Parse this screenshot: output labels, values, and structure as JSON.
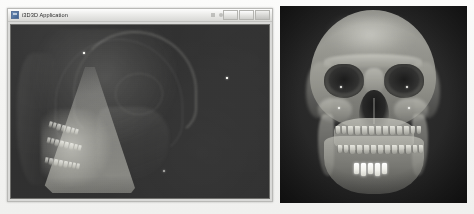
{
  "page": {
    "background_color": "#f2f2f1",
    "width": 474,
    "height": 214
  },
  "app_window": {
    "title": "i3D3D Application",
    "icon": "application-icon",
    "background_color": "#d9d9d7",
    "title_bar": {
      "minimize_label": "",
      "maximize_label": "",
      "close_label": ""
    },
    "viewport": {
      "name": "3d-volume-viewport",
      "background_color": "#2e2e2e",
      "render_type": "lateral cone-beam volume rendering",
      "markers": [
        {
          "id": "fiducial-1"
        },
        {
          "id": "fiducial-2"
        },
        {
          "id": "fiducial-3"
        }
      ],
      "tooth_counts": {
        "upper": 7,
        "middle": 8,
        "lower": 8
      }
    }
  },
  "right_panel": {
    "name": "frontal-skull-render",
    "background_color": "#2a2a2a",
    "render_type": "frontal CBCT skull volume rendering",
    "tooth_counts": {
      "upper": 13,
      "lower": 13
    },
    "restoration_count": 5,
    "markers": [
      {
        "id": "fiducial-a"
      },
      {
        "id": "fiducial-b"
      },
      {
        "id": "fiducial-c"
      },
      {
        "id": "fiducial-d"
      }
    ]
  }
}
